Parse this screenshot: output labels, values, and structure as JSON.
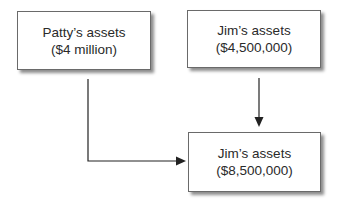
{
  "diagram": {
    "nodes": [
      {
        "id": "patty",
        "title": "Patty’s assets",
        "value": "($4 million)"
      },
      {
        "id": "jim_before",
        "title": "Jim’s assets",
        "value": "($4,500,000)"
      },
      {
        "id": "jim_after",
        "title": "Jim’s assets",
        "value": "($8,500,000)"
      }
    ],
    "edges": [
      {
        "from": "patty",
        "to": "jim_after"
      },
      {
        "from": "jim_before",
        "to": "jim_after"
      }
    ],
    "colors": {
      "border": "#6a6a6a",
      "arrow": "#222222",
      "background": "#ffffff"
    }
  }
}
